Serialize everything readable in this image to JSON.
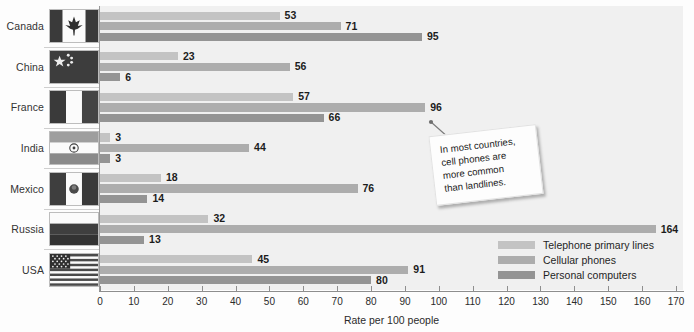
{
  "chart_data": {
    "type": "bar",
    "orientation": "horizontal",
    "title": "",
    "xlabel": "Rate per 100 people",
    "ylabel": "",
    "xlim": [
      0,
      170
    ],
    "xticks": [
      0,
      10,
      20,
      30,
      40,
      50,
      60,
      70,
      80,
      90,
      100,
      110,
      120,
      130,
      140,
      150,
      160,
      170
    ],
    "grid": false,
    "legend_position": "bottom-right",
    "categories": [
      "Canada",
      "China",
      "France",
      "India",
      "Mexico",
      "Russia",
      "USA"
    ],
    "series": [
      {
        "name": "Telephone primary lines",
        "color": "#c3c3c3",
        "values": [
          53,
          23,
          57,
          3,
          18,
          32,
          45
        ]
      },
      {
        "name": "Cellular phones",
        "color": "#adadad",
        "values": [
          71,
          56,
          96,
          44,
          76,
          164,
          91
        ]
      },
      {
        "name": "Personal computers",
        "color": "#949494",
        "values": [
          95,
          6,
          66,
          3,
          14,
          13,
          80
        ]
      }
    ],
    "annotations": [
      {
        "text": "In most countries, cell phones are more common than landlines.",
        "lines": [
          "In most countries,",
          "cell phones are",
          "more common",
          "than landlines."
        ],
        "points_to": {
          "category": "France",
          "series": "Cellular phones",
          "value": 96
        }
      }
    ]
  },
  "legend": {
    "items": [
      {
        "label": "Telephone primary lines",
        "color": "#c3c3c3"
      },
      {
        "label": "Cellular phones",
        "color": "#adadad"
      },
      {
        "label": "Personal computers",
        "color": "#949494"
      }
    ]
  },
  "countries": [
    {
      "name": "Canada",
      "flag": "flag-canada"
    },
    {
      "name": "China",
      "flag": "flag-china"
    },
    {
      "name": "France",
      "flag": "flag-france"
    },
    {
      "name": "India",
      "flag": "flag-india"
    },
    {
      "name": "Mexico",
      "flag": "flag-mexico"
    },
    {
      "name": "Russia",
      "flag": "flag-russia"
    },
    {
      "name": "USA",
      "flag": "flag-usa"
    }
  ]
}
